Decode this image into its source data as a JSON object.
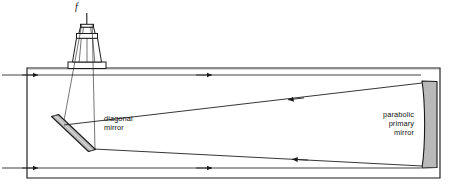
{
  "diagram": {
    "type": "optical-ray-diagram",
    "labels": {
      "focal_point": "f",
      "diagonal_mirror": "diagonal\nmirror",
      "primary_mirror": "parabolic\nprimary\nmirror"
    },
    "colors": {
      "stroke": "#1a1a1a",
      "mirror_fill": "#b8b8b8",
      "tube_fill": "#ffffff",
      "background": "#ffffff",
      "ray": "#222222"
    },
    "components": [
      {
        "name": "telescope-tube",
        "shape": "rectangle",
        "x": 27,
        "y": 68,
        "width": 413,
        "height": 110
      },
      {
        "name": "eyepiece-assembly",
        "shape": "trapezoid-stack",
        "x": 68,
        "y": 22,
        "width": 38,
        "height": 46
      },
      {
        "name": "focal-line",
        "shape": "line",
        "from": [
          86,
          12
        ],
        "to": [
          86,
          30
        ]
      },
      {
        "name": "diagonal-mirror",
        "shape": "parallelogram",
        "angle_deg": 45,
        "x": 50,
        "y": 115,
        "width": 46,
        "height": 36
      },
      {
        "name": "parabolic-primary-mirror",
        "shape": "concave-bar",
        "x": 420,
        "y": 82,
        "width": 17,
        "height": 86
      }
    ],
    "rays": [
      {
        "name": "incoming-ray-upper",
        "from": [
          2,
          75
        ],
        "to": [
          420,
          75
        ],
        "arrows": [
          [
            42,
            75
          ],
          [
            212,
            75
          ]
        ],
        "direction": "right"
      },
      {
        "name": "incoming-ray-lower",
        "from": [
          2,
          168
        ],
        "to": [
          420,
          168
        ],
        "arrows": [
          [
            42,
            168
          ],
          [
            212,
            168
          ]
        ],
        "direction": "right"
      },
      {
        "name": "reflected-ray-upper",
        "from": [
          423,
          84
        ],
        "to": [
          78,
          126
        ],
        "arrows": [
          [
            288,
            101
          ]
        ],
        "direction": "left"
      },
      {
        "name": "reflected-ray-lower",
        "from": [
          423,
          166
        ],
        "to": [
          92,
          145
        ],
        "arrows": [
          [
            292,
            155
          ]
        ],
        "direction": "left"
      },
      {
        "name": "converging-beam-left",
        "from": [
          62,
          124
        ],
        "to": [
          79,
          30
        ],
        "direction": "up"
      },
      {
        "name": "converging-beam-right",
        "from": [
          94,
          148
        ],
        "to": [
          92,
          30
        ],
        "direction": "up"
      }
    ]
  }
}
